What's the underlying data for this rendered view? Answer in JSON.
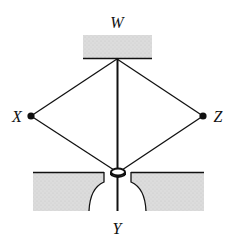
{
  "diagram": {
    "labels": {
      "top": "W",
      "left": "X",
      "right": "Z",
      "bottom": "Y"
    },
    "colors": {
      "line": "#111111",
      "block_fill": "#d8d8d8",
      "background": "#ffffff"
    }
  }
}
